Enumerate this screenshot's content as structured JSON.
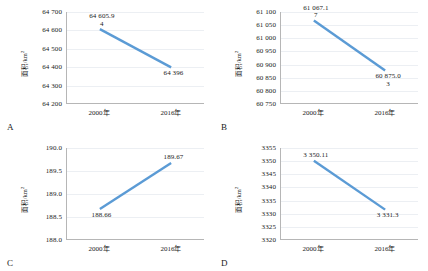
{
  "figure": {
    "line_color": "#5B9BD5",
    "axis_color": "#b6b6b6",
    "grid_color": "#eceff3",
    "background": "#ffffff"
  },
  "panels": [
    {
      "letter": "A",
      "ylabel": "面积/km",
      "ylabel_sup": "2",
      "categories": [
        "2000年",
        "2016年"
      ],
      "yticks": [
        "64 200",
        "64 300",
        "64 400",
        "64 500",
        "64 600",
        "64 700"
      ],
      "labels": [
        "64 605.9\n4",
        "64 396"
      ],
      "chart_data": {
        "type": "line",
        "title": "A",
        "xlabel": "",
        "ylabel": "面积/km2",
        "categories": [
          "2000年",
          "2016年"
        ],
        "values": [
          64605.94,
          64396
        ],
        "ylim": [
          64200,
          64700
        ],
        "ytick_step": 100,
        "grid": true,
        "legend": "none",
        "annotations": [
          "64 605.94",
          "64 396"
        ]
      }
    },
    {
      "letter": "B",
      "ylabel": "面积/km",
      "ylabel_sup": "2",
      "categories": [
        "2000年",
        "2016年"
      ],
      "yticks": [
        "60 750",
        "60 800",
        "60 850",
        "60 900",
        "60 950",
        "61 000",
        "61 050",
        "61 100"
      ],
      "labels": [
        "61 067.1\n7",
        "60 875.0\n3"
      ],
      "chart_data": {
        "type": "line",
        "title": "B",
        "xlabel": "",
        "ylabel": "面积/km2",
        "categories": [
          "2000年",
          "2016年"
        ],
        "values": [
          61067.17,
          60875.03
        ],
        "ylim": [
          60750,
          61100
        ],
        "ytick_step": 50,
        "grid": true,
        "legend": "none",
        "annotations": [
          "61 067.17",
          "60 875.03"
        ]
      }
    },
    {
      "letter": "C",
      "ylabel": "面积/km",
      "ylabel_sup": "2",
      "categories": [
        "2000年",
        "2016年"
      ],
      "yticks": [
        "188.0",
        "188.5",
        "189.0",
        "189.5",
        "190.0"
      ],
      "labels": [
        "188.66",
        "189.67"
      ],
      "chart_data": {
        "type": "line",
        "title": "C",
        "xlabel": "",
        "ylabel": "面积/km2",
        "categories": [
          "2000年",
          "2016年"
        ],
        "values": [
          188.66,
          189.67
        ],
        "ylim": [
          188.0,
          190.0
        ],
        "ytick_step": 0.5,
        "grid": true,
        "legend": "none",
        "annotations": [
          "188.66",
          "189.67"
        ]
      }
    },
    {
      "letter": "D",
      "ylabel": "面积/km",
      "ylabel_sup": "2",
      "categories": [
        "2000年",
        "2016年"
      ],
      "yticks": [
        "3320",
        "3325",
        "3330",
        "3335",
        "3340",
        "3345",
        "3350",
        "3355"
      ],
      "labels": [
        "3 350.11",
        "3 331.3"
      ],
      "chart_data": {
        "type": "line",
        "title": "D",
        "xlabel": "",
        "ylabel": "面积/km2",
        "categories": [
          "2000年",
          "2016年"
        ],
        "values": [
          3350.11,
          3331.3
        ],
        "ylim": [
          3320,
          3355
        ],
        "ytick_step": 5,
        "grid": true,
        "legend": "none",
        "annotations": [
          "3 350.11",
          "3 331.3"
        ]
      }
    }
  ]
}
